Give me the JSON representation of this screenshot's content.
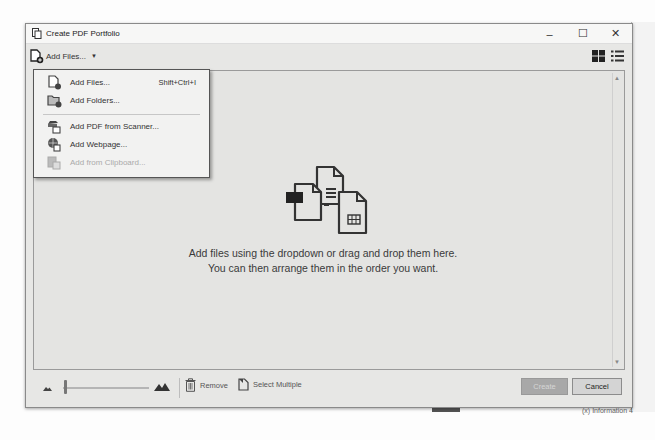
{
  "window": {
    "title": "Create PDF Portfolio",
    "controls": [
      "minimize",
      "maximize",
      "close"
    ],
    "minimize_glyph": "–",
    "maximize_glyph": "☐",
    "close_glyph": "✕"
  },
  "toolbar": {
    "add_files_label": "Add Files...",
    "dropdown_glyph": "▼",
    "view_modes": [
      "grid-view",
      "list-view"
    ]
  },
  "add_files_menu": {
    "items": [
      {
        "label": "Add Files...",
        "mnemonic": "F",
        "shortcut": "Shift+Ctrl+I",
        "icon": "add-file-icon",
        "enabled": true
      },
      {
        "label": "Add Folders...",
        "mnemonic": "r",
        "shortcut": "",
        "icon": "add-folder-icon",
        "enabled": true
      },
      {
        "label": "Add PDF from Scanner...",
        "mnemonic": "S",
        "shortcut": "",
        "icon": "scanner-icon",
        "enabled": true
      },
      {
        "label": "Add Webpage...",
        "mnemonic": "W",
        "shortcut": "",
        "icon": "webpage-icon",
        "enabled": true
      },
      {
        "label": "Add from Clipboard...",
        "mnemonic": "C",
        "shortcut": "",
        "icon": "clipboard-icon",
        "enabled": false
      }
    ]
  },
  "content": {
    "empty_line1": "Add files using the dropdown or drag and drop them here.",
    "empty_line2": "You can then arrange them in the order you want.",
    "scroll_up": "▲",
    "scroll_down": "▼"
  },
  "bottombar": {
    "remove_label": "Remove",
    "select_multiple_label": "Select Multiple",
    "create_label": "Create",
    "cancel_label": "Cancel",
    "create_enabled": false
  },
  "background": {
    "footer_text": "(x) Information 4"
  }
}
